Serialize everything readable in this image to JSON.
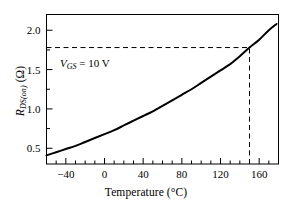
{
  "figure": {
    "background_color": "#ffffff",
    "foreground_color": "#000000",
    "width": 292,
    "height": 208
  },
  "axes": {
    "x_label_prefix": "Temperature (",
    "x_label_unit": "°C",
    "x_label_suffix": ")",
    "x_label_full": "Temperature (°C)",
    "y_label_main": "R",
    "y_label_sub": "DS(on)",
    "y_label_unit": "(Ω)",
    "y_label_full": "R_DS(on) (Ω)",
    "x_ticks": [
      -40,
      0,
      40,
      80,
      120,
      160
    ],
    "x_tick_labels": [
      "−40",
      "0",
      "40",
      "80",
      "120",
      "160"
    ],
    "y_ticks": [
      0.5,
      1.0,
      1.5,
      2.0
    ],
    "y_tick_labels": [
      "0.5",
      "1.0",
      "1.5",
      "2.0"
    ],
    "x_minor_step": 10,
    "y_minor_step": 0.25,
    "xlim": [
      -60,
      180
    ],
    "ylim": [
      0.3,
      2.2
    ],
    "grid": false,
    "frame": "box"
  },
  "annotations": {
    "vgs": {
      "symbol": "V",
      "subscript": "GS",
      "equals": " = 10 V",
      "text": "V_GS = 10 V",
      "x": 25,
      "y": 1.67
    }
  },
  "guides": {
    "horizontal_dashed": {
      "y_value": 1.78,
      "x_from": -60,
      "x_to": 150,
      "style": "dashed"
    },
    "vertical_dashed": {
      "x_value": 150,
      "y_from": 0.3,
      "y_to": 1.78,
      "style": "dashed"
    }
  },
  "chart_data": {
    "type": "line",
    "title": "",
    "xlabel": "Temperature (°C)",
    "ylabel": "R_DS(on) (Ω)",
    "xlim": [
      -60,
      180
    ],
    "ylim": [
      0.3,
      2.2
    ],
    "grid": false,
    "legend": null,
    "series": [
      {
        "name": "R_DS(on) vs Temperature (V_GS = 10 V)",
        "x": [
          -60,
          -50,
          -40,
          -30,
          -20,
          -10,
          0,
          10,
          20,
          30,
          40,
          50,
          60,
          70,
          80,
          90,
          100,
          110,
          120,
          130,
          140,
          150,
          160,
          170,
          178
        ],
        "values": [
          0.41,
          0.45,
          0.49,
          0.53,
          0.58,
          0.63,
          0.68,
          0.73,
          0.79,
          0.85,
          0.91,
          0.97,
          1.04,
          1.11,
          1.18,
          1.25,
          1.33,
          1.41,
          1.49,
          1.57,
          1.67,
          1.78,
          1.88,
          2.0,
          2.08
        ]
      }
    ],
    "markers": [
      {
        "name": "operating-point",
        "x": 150,
        "y": 1.78,
        "label": ""
      }
    ],
    "annotations": [
      {
        "text": "V_GS = 10 V",
        "x": 25,
        "y": 1.67
      }
    ]
  }
}
